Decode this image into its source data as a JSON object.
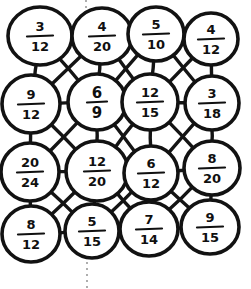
{
  "page": {
    "background_color": "#ffffff",
    "ink_color": "#121212",
    "guide_color": "#9a9a9a",
    "width": 251,
    "height": 289
  },
  "guides": [
    {
      "name": "top-dotted-guide",
      "x": 86,
      "y1": 0,
      "y2": 16
    },
    {
      "name": "bottom-dotted-guide",
      "x": 87,
      "y1": 262,
      "y2": 289
    }
  ],
  "grid": {
    "rows": 4,
    "cols": 4,
    "nodes": [
      {
        "id": "r1c1",
        "row": 1,
        "col": 1,
        "numerator": "3",
        "denominator": "12",
        "cx": 40,
        "cy": 36,
        "rx": 32,
        "ry": 29
      },
      {
        "id": "r1c2",
        "row": 1,
        "col": 2,
        "numerator": "4",
        "denominator": "20",
        "cx": 102,
        "cy": 36,
        "rx": 30,
        "ry": 28
      },
      {
        "id": "r1c3",
        "row": 1,
        "col": 3,
        "numerator": "5",
        "denominator": "10",
        "cx": 156,
        "cy": 34,
        "rx": 28,
        "ry": 27
      },
      {
        "id": "r1c4",
        "row": 1,
        "col": 4,
        "numerator": "4",
        "denominator": "12",
        "cx": 211,
        "cy": 39,
        "rx": 27,
        "ry": 26
      },
      {
        "id": "r2c1",
        "row": 2,
        "col": 1,
        "numerator": "9",
        "denominator": "12",
        "cx": 31,
        "cy": 104,
        "rx": 29,
        "ry": 29
      },
      {
        "id": "r2c2",
        "row": 2,
        "col": 2,
        "numerator": "6",
        "denominator": "9",
        "cx": 97,
        "cy": 102,
        "rx": 29,
        "ry": 28
      },
      {
        "id": "r2c3",
        "row": 2,
        "col": 3,
        "numerator": "12",
        "denominator": "15",
        "cx": 150,
        "cy": 102,
        "rx": 28,
        "ry": 28
      },
      {
        "id": "r2c4",
        "row": 2,
        "col": 4,
        "numerator": "3",
        "denominator": "18",
        "cx": 212,
        "cy": 103,
        "rx": 27,
        "ry": 27
      },
      {
        "id": "r3c1",
        "row": 3,
        "col": 1,
        "numerator": "20",
        "denominator": "24",
        "cx": 30,
        "cy": 172,
        "rx": 29,
        "ry": 29
      },
      {
        "id": "r3c2",
        "row": 3,
        "col": 2,
        "numerator": "12",
        "denominator": "20",
        "cx": 97,
        "cy": 171,
        "rx": 31,
        "ry": 30
      },
      {
        "id": "r3c3",
        "row": 3,
        "col": 3,
        "numerator": "6",
        "denominator": "12",
        "cx": 151,
        "cy": 173,
        "rx": 27,
        "ry": 27
      },
      {
        "id": "r3c4",
        "row": 3,
        "col": 4,
        "numerator": "8",
        "denominator": "20",
        "cx": 212,
        "cy": 168,
        "rx": 28,
        "ry": 27
      },
      {
        "id": "r4c1",
        "row": 4,
        "col": 1,
        "numerator": "8",
        "denominator": "12",
        "cx": 31,
        "cy": 234,
        "rx": 29,
        "ry": 28
      },
      {
        "id": "r4c2",
        "row": 4,
        "col": 2,
        "numerator": "5",
        "denominator": "15",
        "cx": 92,
        "cy": 231,
        "rx": 27,
        "ry": 27
      },
      {
        "id": "r4c3",
        "row": 4,
        "col": 3,
        "numerator": "7",
        "denominator": "14",
        "cx": 149,
        "cy": 229,
        "rx": 29,
        "ry": 27
      },
      {
        "id": "r4c4",
        "row": 4,
        "col": 4,
        "numerator": "9",
        "denominator": "15",
        "cx": 210,
        "cy": 227,
        "rx": 29,
        "ry": 27
      }
    ],
    "links": [
      {
        "from": "r1c1",
        "to": "r1c2"
      },
      {
        "from": "r1c2",
        "to": "r1c3"
      },
      {
        "from": "r1c3",
        "to": "r1c4"
      },
      {
        "from": "r2c1",
        "to": "r2c2"
      },
      {
        "from": "r2c2",
        "to": "r2c3"
      },
      {
        "from": "r2c3",
        "to": "r2c4"
      },
      {
        "from": "r3c1",
        "to": "r3c2"
      },
      {
        "from": "r3c2",
        "to": "r3c3"
      },
      {
        "from": "r3c3",
        "to": "r3c4"
      },
      {
        "from": "r4c1",
        "to": "r4c2"
      },
      {
        "from": "r4c2",
        "to": "r4c3"
      },
      {
        "from": "r4c3",
        "to": "r4c4"
      },
      {
        "from": "r1c1",
        "to": "r2c1"
      },
      {
        "from": "r1c2",
        "to": "r2c2"
      },
      {
        "from": "r1c3",
        "to": "r2c3"
      },
      {
        "from": "r1c4",
        "to": "r2c4"
      },
      {
        "from": "r2c1",
        "to": "r3c1"
      },
      {
        "from": "r2c2",
        "to": "r3c2"
      },
      {
        "from": "r2c3",
        "to": "r3c3"
      },
      {
        "from": "r2c4",
        "to": "r3c4"
      },
      {
        "from": "r3c1",
        "to": "r4c1"
      },
      {
        "from": "r3c2",
        "to": "r4c2"
      },
      {
        "from": "r3c3",
        "to": "r4c3"
      },
      {
        "from": "r3c4",
        "to": "r4c4"
      },
      {
        "from": "r1c1",
        "to": "r2c2"
      },
      {
        "from": "r1c2",
        "to": "r2c1"
      },
      {
        "from": "r1c2",
        "to": "r2c3"
      },
      {
        "from": "r1c3",
        "to": "r2c2"
      },
      {
        "from": "r1c3",
        "to": "r2c4"
      },
      {
        "from": "r1c4",
        "to": "r2c3"
      },
      {
        "from": "r2c1",
        "to": "r3c2"
      },
      {
        "from": "r2c2",
        "to": "r3c1"
      },
      {
        "from": "r2c2",
        "to": "r3c3"
      },
      {
        "from": "r2c3",
        "to": "r3c2"
      },
      {
        "from": "r2c3",
        "to": "r3c4"
      },
      {
        "from": "r2c4",
        "to": "r3c3"
      },
      {
        "from": "r3c1",
        "to": "r4c2"
      },
      {
        "from": "r3c2",
        "to": "r4c1"
      },
      {
        "from": "r3c2",
        "to": "r4c3"
      },
      {
        "from": "r3c3",
        "to": "r4c2"
      },
      {
        "from": "r3c3",
        "to": "r4c4"
      },
      {
        "from": "r3c4",
        "to": "r4c3"
      }
    ]
  }
}
